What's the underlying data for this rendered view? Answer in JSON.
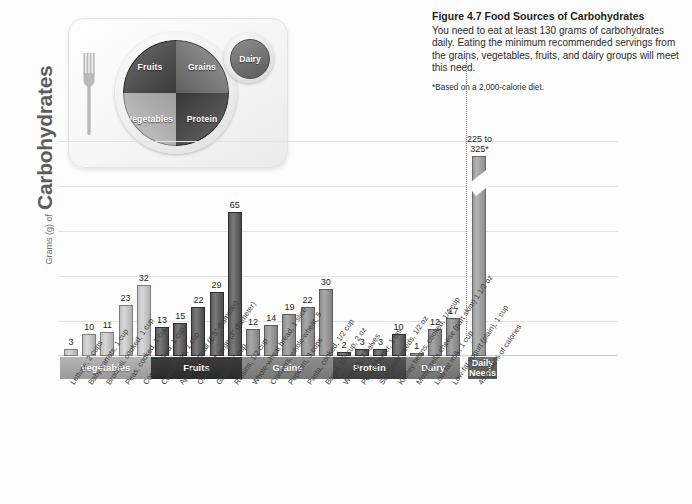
{
  "figure": {
    "number": "Figure 4.7",
    "title": "Food Sources of Carbohydrates",
    "body": "You need to eat at least 130 grams of carbohydrates daily. Eating the minimum recommended servings from the grains, vegetables, fruits, and dairy groups will meet this need.",
    "footnote": "*Based on a 2,000-calorie diet."
  },
  "plate": {
    "fruits_label": "Fruits",
    "grains_label": "Grains",
    "vegetables_label": "Vegetables",
    "protein_label": "Protein",
    "dairy_label": "Dairy"
  },
  "axis": {
    "y_title_small": "Grams (g) of",
    "y_title_big": "Carbohydrates"
  },
  "groups": [
    {
      "name": "Vegetables",
      "color": "#9a9a9a",
      "count": 5
    },
    {
      "name": "Fruits",
      "color": "#2a2a2a",
      "count": 5
    },
    {
      "name": "Grains",
      "color": "#777777",
      "count": 5
    },
    {
      "name": "Protein",
      "color": "#3f3f3f",
      "count": 4
    },
    {
      "name": "Dairy",
      "color": "#717171",
      "count": 3
    },
    {
      "name": "Daily\nNeeds",
      "color": "#565656",
      "count": 1
    }
  ],
  "chart_data": {
    "type": "bar",
    "title": "Food Sources of Carbohydrates",
    "xlabel": "",
    "ylabel": "Grams (g) of Carbohydrates",
    "ylim": [
      0,
      70
    ],
    "grid": true,
    "legend": "none",
    "note": "Final bar uses a broken axis; its true value is 225 to 325 g.",
    "categories": [
      "Lettuce, 2 cups",
      "Baby carrots, 1 cup",
      "Broccoli, cooked, 1 cup",
      "Peas, cooked, 1 cup",
      "Corn, cooked, 1 cup",
      "Cantaloupe, 1 cup",
      "Apple, 1 small (2.5\" diameter)",
      "Orange, 1 large (3\" diameter)",
      "Grapes, 1 cup",
      "Raisins, 1/2 cup",
      "Whole-wheat bread, 1 slice",
      "Crackers, whole-wheat, 5",
      "Popcorn, 3 cups",
      "Pasta, cooked, 1/2 cup",
      "Bagel, 1/2 cup, 2 oz",
      "Walnuts, 7 halves",
      "Peanut butter, 1 tbs",
      "Sunflower seeds, 1/2 oz",
      "Kidney beans, cooked, 1/4 cup",
      "Mozzarella cheese (part skim) 1 1/2 oz",
      "Low-fat milk, 1 cup",
      "Low-fat yogurt (plain), 1 cup",
      "45 to 65% of calories"
    ],
    "values": [
      3,
      10,
      11,
      23,
      32,
      13,
      15,
      22,
      29,
      65,
      12,
      14,
      19,
      22,
      30,
      2,
      3,
      3,
      10,
      1,
      12,
      17,
      275
    ],
    "value_labels": [
      "3",
      "10",
      "11",
      "23",
      "32",
      "13",
      "15",
      "22",
      "29",
      "65",
      "12",
      "14",
      "19",
      "22",
      "30",
      "2",
      "3",
      "3",
      "10",
      "1",
      "12",
      "17",
      "225 to\n325*"
    ],
    "group_of": [
      "Vegetables",
      "Vegetables",
      "Vegetables",
      "Vegetables",
      "Vegetables",
      "Fruits",
      "Fruits",
      "Fruits",
      "Fruits",
      "Fruits",
      "Grains",
      "Grains",
      "Grains",
      "Grains",
      "Grains",
      "Protein",
      "Protein",
      "Protein",
      "Protein",
      "Dairy",
      "Dairy",
      "Dairy",
      "Daily Needs"
    ]
  }
}
